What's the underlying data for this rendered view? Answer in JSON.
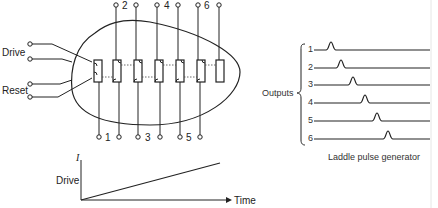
{
  "device": {
    "input_labels": {
      "drive": "Drive",
      "reset": "Reset"
    },
    "top_terminals": [
      "2",
      "4",
      "6"
    ],
    "bottom_terminals": [
      "1",
      "3",
      "5"
    ],
    "element_count": 7
  },
  "drive_graph": {
    "y_axis_symbol": "I",
    "y_label": "Drive",
    "x_label": "Time",
    "type": "linear ramp"
  },
  "outputs": {
    "group_label": "Outputs",
    "channels": [
      "1",
      "2",
      "3",
      "4",
      "5",
      "6"
    ],
    "caption": "Laddle pulse generator"
  }
}
